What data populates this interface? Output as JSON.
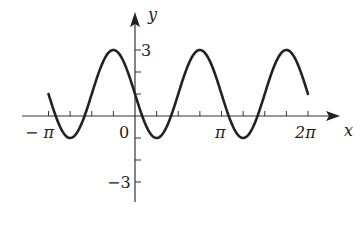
{
  "chart_data": {
    "type": "line",
    "title": "",
    "function": "y = 1 - 2 sin(2x)",
    "xlabel": "x",
    "ylabel": "y",
    "x_tick_labels": [
      "−π",
      "0",
      "π",
      "2π"
    ],
    "x_tick_values": [
      -3.14159,
      0,
      3.14159,
      6.28319
    ],
    "minor_tick_step": "π/4",
    "y_tick_labels": [
      "3",
      "−3"
    ],
    "y_tick_values": [
      3,
      -3
    ],
    "y_minor_ticks": [
      2,
      1,
      -1,
      -2
    ],
    "xlim": [
      -3.14159,
      6.28319
    ],
    "ylim": [
      -4,
      4
    ],
    "grid": false,
    "legend": null,
    "series": [
      {
        "name": "curve",
        "domain": [
          -3.14159,
          6.28319
        ],
        "amplitude": 2,
        "midline": 1,
        "period": "π",
        "max": 3,
        "min": -1
      }
    ],
    "colors": {
      "axis": "#333333",
      "curve": "#222222"
    }
  },
  "labels": {
    "x_axis": "x",
    "y_axis": "y",
    "neg_pi": "− π",
    "zero": "0",
    "pi": "π",
    "two_pi": "2π",
    "y_three": "3",
    "y_neg_three": "−3"
  }
}
